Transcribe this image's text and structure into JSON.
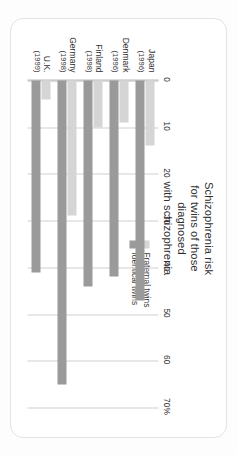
{
  "chart_data": {
    "type": "bar",
    "orientation": "horizontal",
    "title": "Schizophrenia risk for twins of those diagnosed with schizophrenia",
    "title_lines": [
      "Schizophrenia risk",
      "for twins of those",
      "diagnosed",
      "with schizophrenia"
    ],
    "xlabel": "",
    "ylabel": "",
    "xlim": [
      0,
      70
    ],
    "xticks": [
      0,
      10,
      20,
      30,
      40,
      50,
      60,
      70
    ],
    "xtick_labels": [
      "0",
      "10",
      "20",
      "30",
      "40",
      "50",
      "60",
      "70%"
    ],
    "grid": true,
    "legend_position": "top-right",
    "categories": [
      "Japan",
      "Denmark",
      "Finland",
      "Germany",
      "U.K."
    ],
    "category_years": [
      "(1996)",
      "(1996)",
      "(1998)",
      "(1998)",
      "(1999)"
    ],
    "series": [
      {
        "name": "Fraternal twins",
        "color": "#d5d5d5",
        "values": [
          14,
          9,
          10,
          29,
          4
        ]
      },
      {
        "name": "Identical twins",
        "color": "#9a9a9a",
        "values": [
          47,
          42,
          44,
          65,
          41
        ]
      }
    ]
  },
  "card": {
    "background": "#ffffff",
    "border_color": "#e3e3e3"
  },
  "axis": {
    "line_color": "#b9b9b9",
    "grid_color": "#cfcfcf"
  }
}
